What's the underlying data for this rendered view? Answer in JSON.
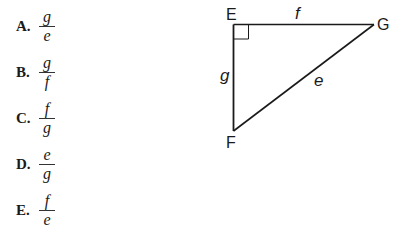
{
  "question": {
    "options": [
      {
        "letter": "A.",
        "numerator": "g",
        "denominator": "e"
      },
      {
        "letter": "B.",
        "numerator": "g",
        "denominator": "f"
      },
      {
        "letter": "C.",
        "numerator": "f",
        "denominator": "g"
      },
      {
        "letter": "D.",
        "numerator": "e",
        "denominator": "g"
      },
      {
        "letter": "E.",
        "numerator": "f",
        "denominator": "e"
      }
    ]
  },
  "figure": {
    "vertices": {
      "E": "E",
      "F": "F",
      "G": "G"
    },
    "sides": {
      "EG": "f",
      "EF": "g",
      "FG": "e"
    },
    "right_angle_at": "E"
  }
}
